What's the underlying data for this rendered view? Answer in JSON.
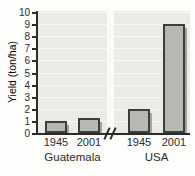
{
  "chart_data": {
    "type": "bar",
    "title": "",
    "ylabel": "Yield (ton/ha)",
    "xlabel": "",
    "ylim": [
      0,
      10
    ],
    "ytick_labels": [
      "0",
      "1",
      "2",
      "3",
      "4",
      "5",
      "6",
      "7",
      "8",
      "9",
      "10"
    ],
    "grid": true,
    "axis_break_between_groups": true,
    "break_symbol": "//",
    "groups": [
      {
        "label": "Guatemala",
        "categories": [
          "1945",
          "2001"
        ],
        "values": [
          1.0,
          1.2
        ]
      },
      {
        "label": "USA",
        "categories": [
          "1945",
          "2001"
        ],
        "values": [
          2.0,
          9.0
        ]
      }
    ],
    "colors": {
      "bar_fill": "#b5b8b3",
      "bar_border": "#3d3d3b",
      "bar_shadow": "#a3a6a0",
      "plot_background": "#eaebe7",
      "gridline": "#f6f7f3",
      "axis_and_text": "#2b2b29",
      "break_stripe": "#fafbf7"
    }
  }
}
